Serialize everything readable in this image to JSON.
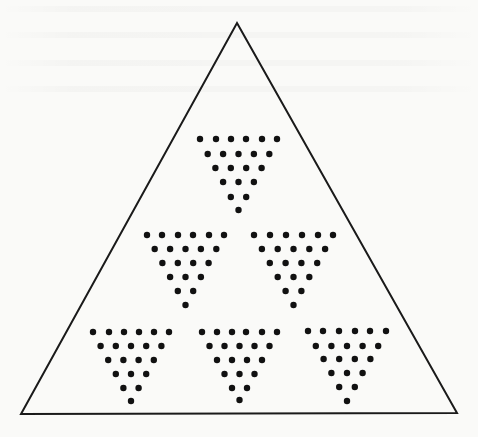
{
  "diagram": {
    "outer_triangle": {
      "apex": [
        237,
        23
      ],
      "bottom_left": [
        21,
        414
      ],
      "bottom_right": [
        457,
        413
      ],
      "stroke": "#1a1a1a",
      "stroke_width": 2
    },
    "dot_style": {
      "radius": 3.2,
      "fill": "#111111"
    },
    "dot_row_counts": [
      6,
      5,
      4,
      3,
      2,
      1
    ],
    "dot_groups": [
      {
        "name": "tier1-center",
        "row1_x": [
          200,
          216,
          231,
          246,
          262,
          277
        ],
        "row_y": [
          139,
          154,
          168,
          182,
          197,
          210
        ]
      },
      {
        "name": "tier2-left",
        "row1_x": [
          147,
          162,
          178,
          193,
          209,
          224
        ],
        "row_y": [
          235,
          249,
          263,
          277,
          291,
          305
        ]
      },
      {
        "name": "tier2-right",
        "row1_x": [
          254,
          270,
          286,
          302,
          318,
          333
        ],
        "row_y": [
          235,
          249,
          263,
          277,
          291,
          305
        ]
      },
      {
        "name": "tier3-left",
        "row1_x": [
          93,
          109,
          124,
          139,
          154,
          169
        ],
        "row_y": [
          332,
          346,
          360,
          374,
          388,
          401
        ]
      },
      {
        "name": "tier3-center",
        "row1_x": [
          202,
          217,
          232,
          246,
          262,
          277
        ],
        "row_y": [
          332,
          346,
          360,
          374,
          388,
          400
        ]
      },
      {
        "name": "tier3-right",
        "row1_x": [
          308,
          323,
          339,
          355,
          370,
          386
        ],
        "row_y": [
          331,
          346,
          359,
          373,
          387,
          401
        ]
      }
    ],
    "dots_per_group": 21,
    "group_count": 6
  }
}
